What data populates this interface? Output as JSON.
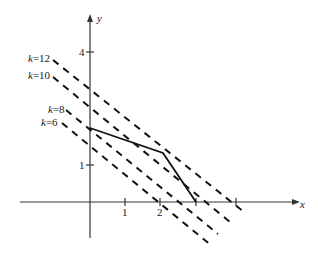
{
  "diagram": {
    "type": "linear-programming-isolines",
    "axes": {
      "x_label": "x",
      "y_label": "y",
      "x_ticks": [
        {
          "value": 1,
          "label": "1"
        },
        {
          "value": 2,
          "label": "2"
        },
        {
          "value": 3,
          "label": ""
        },
        {
          "value": 4,
          "label": ""
        }
      ],
      "y_ticks": [
        {
          "value": 1,
          "label": "1"
        },
        {
          "value": 4,
          "label": "4"
        }
      ]
    },
    "feasible_boundary": {
      "style": "solid",
      "points": [
        [
          0,
          2
        ],
        [
          2.1,
          1.3
        ],
        [
          3,
          0
        ]
      ]
    },
    "level_lines": [
      {
        "label": "k=12",
        "k_text": "k",
        "value_text": "=12",
        "style": "dashed"
      },
      {
        "label": "k=10",
        "k_text": "k",
        "value_text": "=10",
        "style": "dashed"
      },
      {
        "label": "k=8",
        "k_text": "k",
        "value_text": "=8",
        "style": "dashed"
      },
      {
        "label": "k=6",
        "k_text": "k",
        "value_text": "=6",
        "style": "dashed"
      }
    ]
  }
}
